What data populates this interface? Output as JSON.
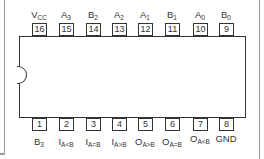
{
  "diagram": {
    "type": "IC pinout",
    "package": "16-pin DIP",
    "top_pins": [
      {
        "number": "16",
        "name": "V",
        "sub": "CC"
      },
      {
        "number": "15",
        "name": "A",
        "sub": "3"
      },
      {
        "number": "14",
        "name": "B",
        "sub": "2"
      },
      {
        "number": "13",
        "name": "A",
        "sub": "2"
      },
      {
        "number": "12",
        "name": "A",
        "sub": "1"
      },
      {
        "number": "11",
        "name": "B",
        "sub": "1"
      },
      {
        "number": "10",
        "name": "A",
        "sub": "0"
      },
      {
        "number": "9",
        "name": "B",
        "sub": "0"
      }
    ],
    "bottom_pins": [
      {
        "number": "1",
        "name": "B",
        "sub": "3"
      },
      {
        "number": "2",
        "name": "I",
        "sub": "A<B"
      },
      {
        "number": "3",
        "name": "I",
        "sub": "A=B"
      },
      {
        "number": "4",
        "name": "I",
        "sub": "A>B"
      },
      {
        "number": "5",
        "name": "O",
        "sub": "A>B"
      },
      {
        "number": "6",
        "name": "O",
        "sub": "A=B"
      },
      {
        "number": "7",
        "name": "O",
        "sub": "A<B"
      },
      {
        "number": "8",
        "name": "GND",
        "sub": ""
      }
    ]
  }
}
